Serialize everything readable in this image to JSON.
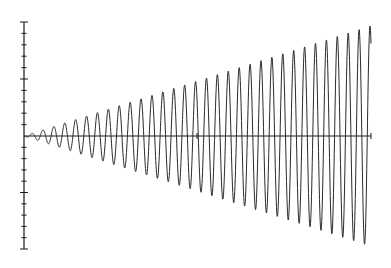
{
  "chart_data": {
    "type": "line",
    "title": "",
    "xlabel": "",
    "ylabel": "",
    "function_description": "Oscillation with linearly increasing amplitude (y = t·sin t style)",
    "series": [
      {
        "name": "oscillation",
        "cycles": 32,
        "peak_positions_px": [
          32,
          370
        ],
        "amplitude_start": 0,
        "amplitude_end": 1.0,
        "color": "#2a2a2a"
      }
    ],
    "axes": {
      "origin_px": [
        24,
        136
      ],
      "x_axis_end_px": 371,
      "y_axis_top_px": 22,
      "y_axis_bottom_px": 249,
      "y_ticks_per_side": 10,
      "y_tick_spacing_px": 11.4,
      "y_major_tick_every": 5,
      "x_mid_tick_px": 197
    },
    "grid": false,
    "legend": null,
    "tick_labels": []
  }
}
